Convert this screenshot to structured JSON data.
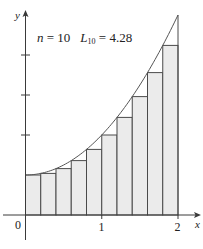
{
  "annotation": {
    "n_var": "n",
    "n_eq": " = 10",
    "L_var": "L",
    "L_sub": "10",
    "L_eq": " = 4.28"
  },
  "axes": {
    "x_label": "x",
    "y_label": "y",
    "x_ticks": [
      "0",
      "1",
      "2"
    ]
  },
  "colors": {
    "bar_fill": "#ebebeb",
    "line": "#4a4a4a"
  },
  "chart_data": {
    "type": "bar",
    "function": "x^2 + 1",
    "interval": [
      0,
      2
    ],
    "n": 10,
    "sum_label": "L10",
    "sum_value": 4.28,
    "categories": [
      "0",
      "0.2",
      "0.4",
      "0.6",
      "0.8",
      "1.0",
      "1.2",
      "1.4",
      "1.6",
      "1.8"
    ],
    "values": [
      1.0,
      1.04,
      1.16,
      1.36,
      1.64,
      2.0,
      2.44,
      2.96,
      3.56,
      4.24
    ],
    "bar_width": 0.2,
    "xlabel": "x",
    "ylabel": "y",
    "x_tick_labels": [
      "0",
      "1",
      "2"
    ],
    "y_ticks_unlabeled": [
      2,
      3,
      4
    ],
    "xlim": [
      0,
      2.3
    ],
    "ylim": [
      -0.6,
      5.1
    ],
    "grid": false,
    "legend": "none"
  }
}
